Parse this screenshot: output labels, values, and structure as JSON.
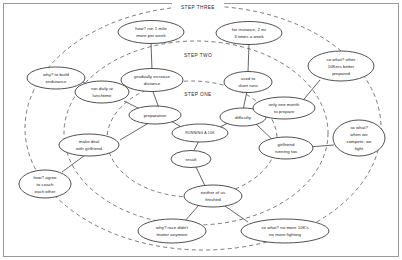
{
  "diagram": {
    "title": "RUNNING A 10K",
    "type": "concentric-mind-map",
    "colors": {
      "ring_stroke": "#6b6b6b",
      "node_stroke": "#3d3d3d",
      "edge_stroke": "#4a4a4a",
      "frame_stroke": "#8f8f8f",
      "text": "#1d1d1d",
      "background": "#ffffff"
    },
    "ring_labels": [
      {
        "id": "step-one",
        "text": "STEP ONE"
      },
      {
        "id": "step-two",
        "text": "STEP TWO"
      },
      {
        "id": "step-three",
        "text": "STEP THREE"
      }
    ],
    "nodes": [
      {
        "id": "core",
        "lines": [
          "RUNNING A 10K"
        ]
      },
      {
        "id": "preparation",
        "lines": [
          "preparation"
        ]
      },
      {
        "id": "difficulty",
        "lines": [
          "difficulty"
        ]
      },
      {
        "id": "result",
        "lines": [
          "result"
        ]
      },
      {
        "id": "gradually-increase-distance",
        "lines": [
          "gradually increase",
          "distance"
        ]
      },
      {
        "id": "run-daily-at-lunchtime",
        "lines": [
          "run daily at",
          "lunchtime"
        ]
      },
      {
        "id": "make-deal-with-girlfriend",
        "lines": [
          "make deal",
          "with girlfriend"
        ]
      },
      {
        "id": "used-to-short-runs",
        "lines": [
          "used to",
          "short runs"
        ]
      },
      {
        "id": "only-one-month-to-prepare",
        "lines": [
          "only one month",
          "to prepare"
        ]
      },
      {
        "id": "girlfriend-running-too",
        "lines": [
          "girlfriend",
          "running too"
        ]
      },
      {
        "id": "neither-of-us-finished",
        "lines": [
          "neither of us",
          "finished"
        ]
      },
      {
        "id": "how-run-1-mile-more-per-week",
        "lines": [
          "how? run 1 mile",
          "more per week"
        ]
      },
      {
        "id": "why-to-build-endurance",
        "lines": [
          "why? to build",
          "endurance"
        ]
      },
      {
        "id": "how-agree-to-coach-each-other",
        "lines": [
          "how? agree",
          "to coach",
          "each other"
        ]
      },
      {
        "id": "for-instance-2-mi-3-times-a-week",
        "lines": [
          "for instance, 2 mi",
          "3 times a week"
        ]
      },
      {
        "id": "so-what-other-10kers-better-prepared",
        "lines": [
          "so what? other",
          "10Kers better",
          "prepared"
        ]
      },
      {
        "id": "so-what-when-we-compete-we-fight",
        "lines": [
          "so what?",
          "when we",
          "compete, we",
          "fight"
        ]
      },
      {
        "id": "why-race-didnt-matter-anymore",
        "lines": [
          "why? race didn't",
          "matter anymore"
        ]
      },
      {
        "id": "so-what-no-more-10ks-no-more-fighting",
        "lines": [
          "so what?  no more 10K's",
          "no more fighting"
        ]
      }
    ]
  }
}
